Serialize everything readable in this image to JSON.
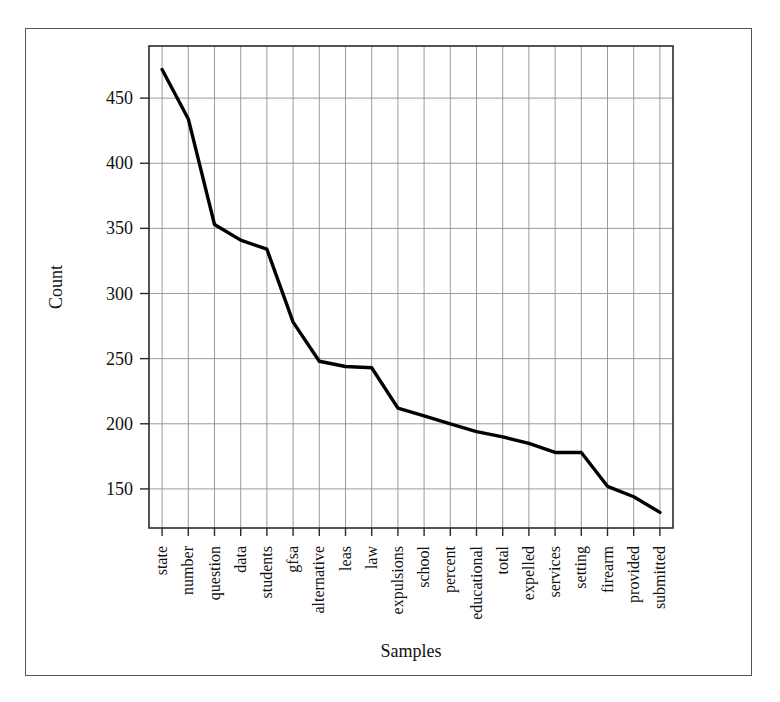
{
  "chart_data": {
    "type": "line",
    "title": "",
    "xlabel": "Samples",
    "ylabel": "Count",
    "categories": [
      "state",
      "number",
      "question",
      "data",
      "students",
      "gfsa",
      "alternative",
      "leas",
      "law",
      "expulsions",
      "school",
      "percent",
      "educational",
      "total",
      "expelled",
      "services",
      "setting",
      "firearm",
      "provided",
      "submitted"
    ],
    "values": [
      472,
      434,
      353,
      341,
      334,
      278,
      248,
      244,
      243,
      212,
      206,
      200,
      194,
      190,
      185,
      178,
      178,
      152,
      144,
      132
    ],
    "series": [
      {
        "name": "Count",
        "values": [
          472,
          434,
          353,
          341,
          334,
          278,
          248,
          244,
          243,
          212,
          206,
          200,
          194,
          190,
          185,
          178,
          178,
          152,
          144,
          132
        ]
      }
    ],
    "ylim": [
      120,
      490
    ],
    "yticks": [
      150,
      200,
      250,
      300,
      350,
      400,
      450
    ],
    "ytick_labels": [
      "150",
      "200",
      "250",
      "300",
      "350",
      "400",
      "450"
    ],
    "grid": true,
    "legend": false,
    "line_color": "#000000",
    "grid_color": "#8e8e8e",
    "frame_color": "#2a2a2a"
  }
}
